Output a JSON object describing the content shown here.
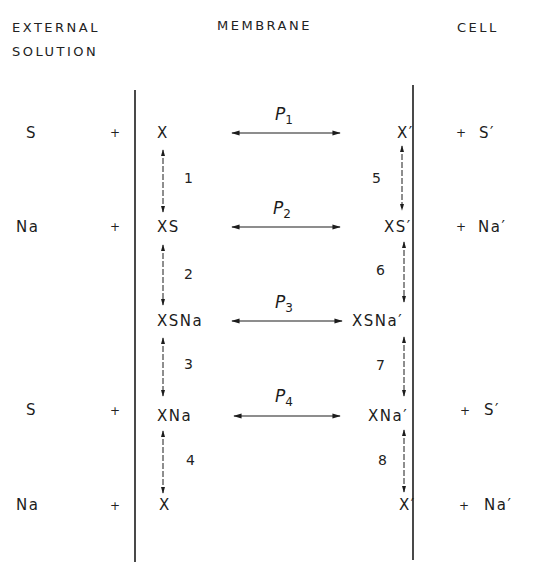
{
  "headers": {
    "external_line1": "EXTERNAL",
    "external_line2": "SOLUTION",
    "membrane": "MEMBRANE",
    "cell": "CELL"
  },
  "external_side": [
    {
      "species": "S",
      "plus": "+"
    },
    {
      "species": "Na",
      "plus": "+"
    },
    {
      "species": "",
      "plus": ""
    },
    {
      "species": "S",
      "plus": "+"
    },
    {
      "species": "Na",
      "plus": "+"
    }
  ],
  "membrane_outer": [
    "X",
    "XS",
    "XSNa",
    "XNa",
    "X"
  ],
  "membrane_inner": [
    "X′",
    "XS′",
    "XSNa′",
    "XNa′",
    "X′"
  ],
  "cell_side": [
    {
      "plus": "+",
      "species": "S′"
    },
    {
      "plus": "+",
      "species": "Na′"
    },
    {
      "plus": "",
      "species": ""
    },
    {
      "plus": "+",
      "species": "S′"
    },
    {
      "plus": "+",
      "species": "Na′"
    }
  ],
  "translocations": [
    {
      "letter": "P",
      "index": "1"
    },
    {
      "letter": "P",
      "index": "2"
    },
    {
      "letter": "P",
      "index": "3"
    },
    {
      "letter": "P",
      "index": "4"
    }
  ],
  "outer_steps": [
    "1",
    "2",
    "3",
    "4"
  ],
  "inner_steps": [
    "5",
    "6",
    "7",
    "8"
  ],
  "colors": {
    "ink": "#1c1c1c",
    "background": "#ffffff"
  }
}
